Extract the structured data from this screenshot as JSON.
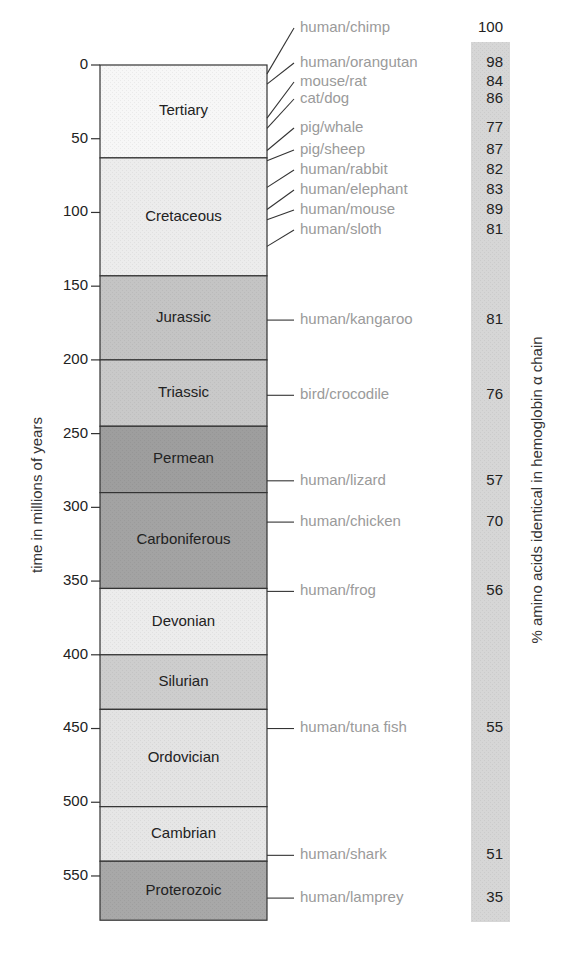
{
  "chart_data": {
    "type": "table",
    "title": "",
    "ylabel": "time in millions of years",
    "right_label": "% amino acids identical in hemoglobin α chain",
    "ylim": [
      0,
      580
    ],
    "y_ticks": [
      0,
      50,
      100,
      150,
      200,
      250,
      300,
      350,
      400,
      450,
      500,
      550
    ],
    "periods": [
      {
        "name": "Tertiary",
        "start": 0,
        "end": 63,
        "color": "#f7f7f7"
      },
      {
        "name": "Cretaceous",
        "start": 63,
        "end": 143,
        "color": "#ececec"
      },
      {
        "name": "Jurassic",
        "start": 143,
        "end": 200,
        "color": "#c4c4c4"
      },
      {
        "name": "Triassic",
        "start": 200,
        "end": 245,
        "color": "#c9c9c9"
      },
      {
        "name": "Permean",
        "start": 245,
        "end": 290,
        "color": "#9e9e9e"
      },
      {
        "name": "Carboniferous",
        "start": 290,
        "end": 355,
        "color": "#a3a3a3"
      },
      {
        "name": "Devonian",
        "start": 355,
        "end": 400,
        "color": "#ececec"
      },
      {
        "name": "Silurian",
        "start": 400,
        "end": 437,
        "color": "#cdcdcd"
      },
      {
        "name": "Ordovician",
        "start": 437,
        "end": 503,
        "color": "#e3e3e3"
      },
      {
        "name": "Cambrian",
        "start": 503,
        "end": 540,
        "color": "#e6e6e6"
      },
      {
        "name": "Proterozoic",
        "start": 540,
        "end": 580,
        "color": "#a8a8a8"
      }
    ],
    "comparisons": [
      {
        "pair": "human/chimp",
        "divergence_my": 6,
        "label_y": 28,
        "percent_identical": 100
      },
      {
        "pair": "human/orangutan",
        "divergence_my": 13,
        "label_y": 63,
        "percent_identical": 98
      },
      {
        "pair": "mouse/rat",
        "divergence_my": 36,
        "label_y": 82,
        "percent_identical": 84
      },
      {
        "pair": "cat/dog",
        "divergence_my": 43,
        "label_y": 99,
        "percent_identical": 86
      },
      {
        "pair": "pig/whale",
        "divergence_my": 58,
        "label_y": 128,
        "percent_identical": 77
      },
      {
        "pair": "pig/sheep",
        "divergence_my": 65,
        "label_y": 150,
        "percent_identical": 87
      },
      {
        "pair": "human/rabbit",
        "divergence_my": 83,
        "label_y": 170,
        "percent_identical": 82
      },
      {
        "pair": "human/elephant",
        "divergence_my": 98,
        "label_y": 190,
        "percent_identical": 83
      },
      {
        "pair": "human/mouse",
        "divergence_my": 105,
        "label_y": 210,
        "percent_identical": 89
      },
      {
        "pair": "human/sloth",
        "divergence_my": 123,
        "label_y": 230,
        "percent_identical": 81
      },
      {
        "pair": "human/kangaroo",
        "divergence_my": 173,
        "label_y": 0,
        "percent_identical": 81
      },
      {
        "pair": "bird/crocodile",
        "divergence_my": 224,
        "label_y": 0,
        "percent_identical": 76
      },
      {
        "pair": "human/lizard",
        "divergence_my": 282,
        "label_y": 0,
        "percent_identical": 57
      },
      {
        "pair": "human/chicken",
        "divergence_my": 310,
        "label_y": 0,
        "percent_identical": 70
      },
      {
        "pair": "human/frog",
        "divergence_my": 357,
        "label_y": 0,
        "percent_identical": 56
      },
      {
        "pair": "human/tuna fish",
        "divergence_my": 450,
        "label_y": 0,
        "percent_identical": 55
      },
      {
        "pair": "human/shark",
        "divergence_my": 536,
        "label_y": 0,
        "percent_identical": 51
      },
      {
        "pair": "human/lamprey",
        "divergence_my": 565,
        "label_y": 0,
        "percent_identical": 35
      }
    ],
    "colors": {
      "axis": "#333333",
      "pair_text": "#9a9a9a",
      "percent_bar": "#d6d6d6"
    }
  }
}
